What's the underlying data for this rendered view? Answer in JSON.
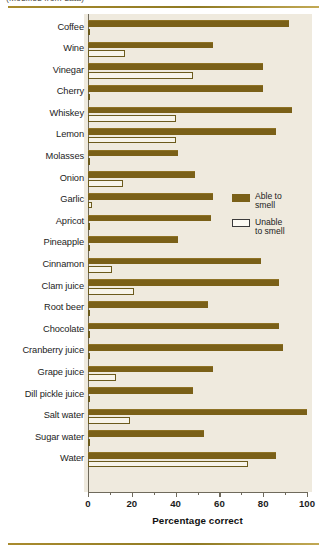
{
  "caption_fragment": "(Modified from data)",
  "legend": {
    "items": [
      {
        "label": "Able to smell",
        "line1": "Able to",
        "line2": "smell",
        "color": "#7a6018",
        "style": "filled"
      },
      {
        "label": "Unable to smell",
        "line1": "Unable",
        "line2": "to smell",
        "color": "#fdfbf4",
        "style": "hollow"
      }
    ]
  },
  "colors": {
    "bar_able": "#7a6018",
    "bar_unable": "#fdfbf4",
    "bar_unable_border": "#6b5a1c",
    "plot_background": "#efeade",
    "page_background": "#ffffff",
    "rule": "#a98b2e",
    "axis": "#6f6a5c"
  },
  "chart_data": {
    "type": "bar",
    "orientation": "horizontal",
    "title": "",
    "xlabel": "Percentage correct",
    "ylabel": "",
    "xlim": [
      0,
      100
    ],
    "xticks": [
      0,
      20,
      40,
      60,
      80,
      100
    ],
    "xtick_labels": [
      "0",
      "20",
      "40",
      "60",
      "80",
      "100"
    ],
    "minor_xticks": [
      10,
      30,
      50,
      70,
      90
    ],
    "grid": false,
    "legend_position": "middle-right",
    "categories": [
      "Coffee",
      "Wine",
      "Vinegar",
      "Cherry",
      "Whiskey",
      "Lemon",
      "Molasses",
      "Onion",
      "Garlic",
      "Apricot",
      "Pineapple",
      "Cinnamon",
      "Clam juice",
      "Root beer",
      "Chocolate",
      "Cranberry juice",
      "Grape juice",
      "Dill pickle juice",
      "Salt water",
      "Sugar water",
      "Water"
    ],
    "series": [
      {
        "name": "Able to smell",
        "color": "#7a6018",
        "values": [
          92,
          57,
          80,
          80,
          93,
          86,
          41,
          49,
          57,
          56,
          41,
          79,
          87,
          55,
          87,
          89,
          57,
          48,
          100,
          53,
          86
        ]
      },
      {
        "name": "Unable to smell",
        "color": "#fdfbf4",
        "values": [
          1,
          17,
          48,
          1,
          40,
          40,
          1,
          16,
          2,
          1,
          1,
          11,
          21,
          1,
          1,
          1,
          13,
          1,
          19,
          1,
          73
        ]
      }
    ]
  }
}
